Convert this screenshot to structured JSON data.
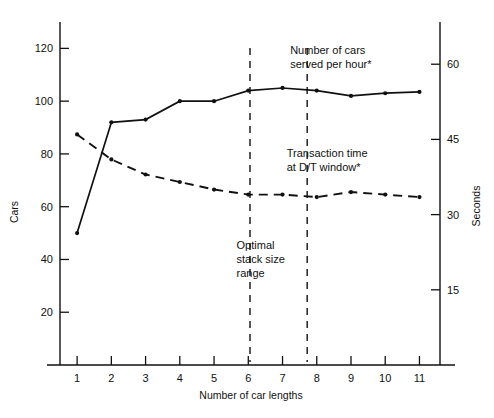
{
  "chart_data": {
    "type": "line",
    "title": "",
    "xlabel": "Number of car lengths",
    "ylabel": "Cars",
    "y2label": "Seconds",
    "x": [
      1,
      2,
      3,
      4,
      5,
      6,
      7,
      8,
      9,
      10,
      11
    ],
    "xticklabels": [
      "1",
      "2",
      "3",
      "4",
      "5",
      "6",
      "7",
      "8",
      "9",
      "10",
      "11"
    ],
    "xlim": [
      0.5,
      11.6
    ],
    "ylim": [
      0,
      130
    ],
    "yticks": [
      20,
      40,
      60,
      80,
      100,
      120
    ],
    "yticklabels": [
      "20",
      "40",
      "60",
      "80",
      "100",
      "120"
    ],
    "y2lim": [
      0,
      68.42
    ],
    "y2ticks": [
      15,
      30,
      45,
      60
    ],
    "y2ticklabels": [
      "15",
      "30",
      "45",
      "60"
    ],
    "grid": false,
    "legend": "annotations-inline",
    "series": [
      {
        "name": "Number of cars served per hour*",
        "axis": "left",
        "style": "solid",
        "marker": "dot",
        "values": [
          50,
          92,
          93,
          100,
          100,
          104,
          105,
          104,
          102,
          103,
          103.5
        ]
      },
      {
        "name": "Transaction time at D/T window*",
        "axis": "right",
        "style": "dashed",
        "marker": "dot",
        "values": [
          46,
          41,
          38,
          36.5,
          35,
          34,
          34,
          33.5,
          34.5,
          34,
          33.5
        ]
      }
    ],
    "annotations": [
      {
        "id": "series-1-label",
        "text_lines": [
          "Number of cars",
          "served per hour*"
        ],
        "x": 8.45,
        "y": 118
      },
      {
        "id": "series-2-label",
        "text_lines": [
          "Transaction time",
          "at D/T window*"
        ],
        "x": 8.35,
        "y": 79
      },
      {
        "id": "optimal-range-label",
        "text_lines": [
          "Optimal",
          "stack size",
          "range"
        ],
        "x": 6.3,
        "y": 44
      }
    ],
    "vlines": [
      {
        "id": "optimal-range-start",
        "x": 6.05,
        "style": "dashed"
      },
      {
        "id": "optimal-range-end",
        "x": 7.72,
        "style": "dashed"
      }
    ]
  }
}
